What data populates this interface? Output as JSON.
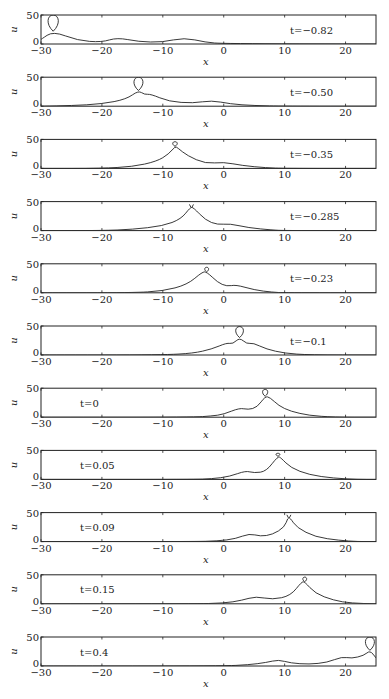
{
  "chart_data": {
    "type": "line",
    "title": "",
    "layout": "11 stacked subplots, shared x range",
    "xlabel": "x",
    "ylabel": "u",
    "xlim": [
      -30,
      25
    ],
    "ylim": [
      0,
      50
    ],
    "xticks": [
      -30,
      -20,
      -10,
      0,
      10,
      20
    ],
    "xtick_labels": [
      "−30",
      "−20",
      "−10",
      "0",
      "10",
      "20"
    ],
    "yticks": [
      0,
      50
    ],
    "ytick_labels": [
      "0",
      "50"
    ],
    "grid": false,
    "panels": [
      {
        "label": "t=−0.82",
        "label_pos": "right",
        "features": [
          {
            "kind": "loop",
            "x": -28,
            "base": 22,
            "top": 50,
            "width": 1.6
          },
          {
            "kind": "cusp",
            "x": -17.5,
            "y": 11
          },
          {
            "kind": "cusp",
            "x": -6.5,
            "y": 11
          }
        ],
        "baseline_points": [
          [
            -30,
            8
          ],
          [
            -28,
            22
          ],
          [
            -24,
            6
          ],
          [
            -20,
            3
          ],
          [
            -17.5,
            11
          ],
          [
            -14,
            4
          ],
          [
            -10,
            3
          ],
          [
            -6.5,
            11
          ],
          [
            -3,
            3
          ],
          [
            0,
            0.5
          ],
          [
            25,
            0
          ]
        ]
      },
      {
        "label": "t=−0.50",
        "label_pos": "right",
        "features": [
          {
            "kind": "loop",
            "x": -14,
            "base": 27,
            "top": 50,
            "width": 1.4
          },
          {
            "kind": "cusp",
            "x": -12,
            "y": 21
          },
          {
            "kind": "cusp",
            "x": -2,
            "y": 10
          }
        ],
        "baseline_points": [
          [
            -30,
            0
          ],
          [
            -25,
            1
          ],
          [
            -20,
            4
          ],
          [
            -16,
            12
          ],
          [
            -14,
            27
          ],
          [
            -13,
            20
          ],
          [
            -12,
            21
          ],
          [
            -9,
            8
          ],
          [
            -5,
            5
          ],
          [
            -2,
            10
          ],
          [
            1,
            4
          ],
          [
            5,
            1
          ],
          [
            10,
            0
          ],
          [
            25,
            0
          ]
        ]
      },
      {
        "label": "t=−0.35",
        "label_pos": "right",
        "features": [
          {
            "kind": "loop",
            "x": -8,
            "base": 38,
            "top": 46,
            "width": 0.7
          },
          {
            "kind": "cusp",
            "x": 0,
            "y": 11
          }
        ],
        "baseline_points": [
          [
            -30,
            0
          ],
          [
            -20,
            0
          ],
          [
            -15,
            3
          ],
          [
            -11,
            12
          ],
          [
            -9,
            25
          ],
          [
            -8,
            38
          ],
          [
            -7.5,
            35
          ],
          [
            -6,
            22
          ],
          [
            -3,
            8
          ],
          [
            0,
            11
          ],
          [
            3,
            5
          ],
          [
            7,
            1
          ],
          [
            10,
            0
          ],
          [
            25,
            0
          ]
        ]
      },
      {
        "label": "t=−0.285",
        "label_pos": "right",
        "features": [
          {
            "kind": "twin-cusp",
            "x": -5.3,
            "y": 40
          },
          {
            "kind": "cusp",
            "x": 1,
            "y": 12
          }
        ],
        "baseline_points": [
          [
            -30,
            0
          ],
          [
            -20,
            0
          ],
          [
            -15,
            2
          ],
          [
            -10,
            8
          ],
          [
            -7,
            20
          ],
          [
            -5.5,
            40
          ],
          [
            -5,
            40
          ],
          [
            -3,
            18
          ],
          [
            -1,
            10
          ],
          [
            1,
            12
          ],
          [
            4,
            5
          ],
          [
            8,
            1
          ],
          [
            10,
            0
          ],
          [
            25,
            0
          ]
        ]
      },
      {
        "label": "t=−0.23",
        "label_pos": "right",
        "features": [
          {
            "kind": "loop",
            "x": -2.8,
            "base": 36,
            "top": 44,
            "width": 0.6
          },
          {
            "kind": "cusp",
            "x": 2,
            "y": 14
          }
        ],
        "baseline_points": [
          [
            -30,
            0
          ],
          [
            -15,
            0
          ],
          [
            -10,
            3
          ],
          [
            -6,
            14
          ],
          [
            -3.5,
            36
          ],
          [
            -2.8,
            36
          ],
          [
            -1,
            18
          ],
          [
            0.5,
            11
          ],
          [
            2,
            14
          ],
          [
            5,
            5
          ],
          [
            8,
            1
          ],
          [
            10,
            0
          ],
          [
            25,
            0
          ]
        ]
      },
      {
        "label": "t=−0.1",
        "label_pos": "right",
        "features": [
          {
            "kind": "loop",
            "x": 2.6,
            "base": 30,
            "top": 49,
            "width": 1.2
          },
          {
            "kind": "cusp",
            "x": 0.5,
            "y": 21
          },
          {
            "kind": "cusp",
            "x": 4.8,
            "y": 21
          }
        ],
        "baseline_points": [
          [
            -30,
            0
          ],
          [
            -10,
            0
          ],
          [
            -5,
            3
          ],
          [
            -2,
            10
          ],
          [
            0.5,
            21
          ],
          [
            1.5,
            19
          ],
          [
            2.6,
            30
          ],
          [
            3.8,
            19
          ],
          [
            4.8,
            21
          ],
          [
            7,
            10
          ],
          [
            10,
            3
          ],
          [
            14,
            0
          ],
          [
            25,
            0
          ]
        ]
      },
      {
        "label": "t=0",
        "label_pos": "left",
        "features": [
          {
            "kind": "loop",
            "x": 6.8,
            "base": 36,
            "top": 48,
            "width": 0.8
          },
          {
            "kind": "cusp",
            "x": 2.6,
            "y": 16
          }
        ],
        "baseline_points": [
          [
            -30,
            0
          ],
          [
            -5,
            0
          ],
          [
            -2,
            2
          ],
          [
            0,
            5
          ],
          [
            2.6,
            16
          ],
          [
            4,
            13
          ],
          [
            5.5,
            17
          ],
          [
            6.8,
            36
          ],
          [
            7.6,
            34
          ],
          [
            9,
            20
          ],
          [
            11,
            10
          ],
          [
            14,
            3
          ],
          [
            18,
            0
          ],
          [
            25,
            0
          ]
        ]
      },
      {
        "label": "t=0.05",
        "label_pos": "left",
        "features": [
          {
            "kind": "loop",
            "x": 8.9,
            "base": 40,
            "top": 45,
            "width": 0.6
          },
          {
            "kind": "cusp",
            "x": 3.6,
            "y": 15
          }
        ],
        "baseline_points": [
          [
            -30,
            0
          ],
          [
            -5,
            0
          ],
          [
            -2,
            1
          ],
          [
            1,
            5
          ],
          [
            3.6,
            15
          ],
          [
            5,
            11
          ],
          [
            7,
            14
          ],
          [
            8.9,
            40
          ],
          [
            9.4,
            37
          ],
          [
            11,
            20
          ],
          [
            14,
            8
          ],
          [
            18,
            2
          ],
          [
            22,
            0
          ],
          [
            25,
            0
          ]
        ]
      },
      {
        "label": "t=0.09",
        "label_pos": "left",
        "features": [
          {
            "kind": "twin-cusp",
            "x": 10.7,
            "y": 41
          },
          {
            "kind": "cusp",
            "x": 4.2,
            "y": 14
          }
        ],
        "baseline_points": [
          [
            -30,
            0
          ],
          [
            -5,
            0
          ],
          [
            -1,
            1
          ],
          [
            2,
            5
          ],
          [
            4.2,
            14
          ],
          [
            6,
            9
          ],
          [
            8,
            12
          ],
          [
            10,
            25
          ],
          [
            10.5,
            41
          ],
          [
            10.9,
            41
          ],
          [
            12,
            24
          ],
          [
            15,
            8
          ],
          [
            19,
            2
          ],
          [
            22,
            0
          ],
          [
            25,
            0
          ]
        ]
      },
      {
        "label": "t=0.15",
        "label_pos": "left",
        "features": [
          {
            "kind": "loop",
            "x": 13.3,
            "base": 38,
            "top": 46,
            "width": 0.6
          },
          {
            "kind": "cusp",
            "x": 5.3,
            "y": 13
          }
        ],
        "baseline_points": [
          [
            -30,
            0
          ],
          [
            -5,
            0
          ],
          [
            0,
            1
          ],
          [
            3,
            6
          ],
          [
            5.3,
            13
          ],
          [
            8,
            7
          ],
          [
            11,
            14
          ],
          [
            12.8,
            38
          ],
          [
            13.3,
            38
          ],
          [
            15,
            18
          ],
          [
            18,
            6
          ],
          [
            21,
            1
          ],
          [
            25,
            0
          ]
        ]
      },
      {
        "label": "t=0.4",
        "label_pos": "left",
        "features": [
          {
            "kind": "loop",
            "x": 24,
            "base": 27,
            "top": 50,
            "width": 1.4
          },
          {
            "kind": "cusp",
            "x": 9,
            "y": 11
          },
          {
            "kind": "cusp",
            "x": 19.4,
            "y": 16
          }
        ],
        "baseline_points": [
          [
            -30,
            0
          ],
          [
            0,
            0
          ],
          [
            4,
            2
          ],
          [
            7,
            6
          ],
          [
            9,
            11
          ],
          [
            11,
            5
          ],
          [
            14,
            3
          ],
          [
            17,
            6
          ],
          [
            19.4,
            16
          ],
          [
            21,
            13
          ],
          [
            23,
            18
          ],
          [
            24,
            27
          ],
          [
            25,
            14
          ]
        ]
      }
    ]
  }
}
